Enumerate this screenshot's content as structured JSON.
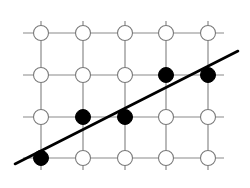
{
  "diagram": {
    "type": "lattice-grid-with-line",
    "grid": {
      "columns": 5,
      "rows": 4,
      "x_centers": [
        41,
        83,
        125,
        166,
        208
      ],
      "y_centers": [
        33,
        75,
        117,
        158
      ],
      "extension": 12,
      "line_color": "#8a8a8a"
    },
    "node_radius": 7.5,
    "nodes_filled": [
      {
        "col": 3,
        "row": 1
      },
      {
        "col": 4,
        "row": 1
      },
      {
        "col": 1,
        "row": 2
      },
      {
        "col": 2,
        "row": 2
      },
      {
        "col": 0,
        "row": 3
      }
    ],
    "filled_color": "#000000",
    "empty_fill": "#ffffff",
    "empty_stroke": "#7a7a7a",
    "fit_line": {
      "x1": 15,
      "y1": 164,
      "x2": 238,
      "y2": 51,
      "color": "#000000"
    }
  }
}
